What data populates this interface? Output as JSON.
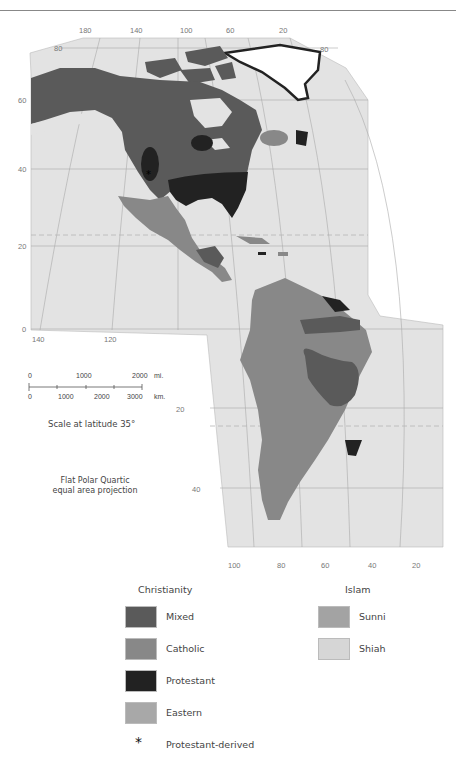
{
  "map": {
    "title": "Religions of the Americas",
    "projection": "Flat Polar Quartic equal area projection",
    "projection_line1": "Flat Polar Quartic",
    "projection_line2": "equal area projection",
    "colors": {
      "ocean": "#e3e3e3",
      "mixed": "#5a5a5a",
      "catholic": "#888888",
      "protestant": "#222222",
      "eastern": "#a8a8a8",
      "sunni": "#a3a3a3",
      "shiah": "#d6d6d6",
      "greenland_ice": "#ffffff",
      "grid": "#a9a9a9"
    },
    "top_longitude_ticks": [
      "180",
      "140",
      "100",
      "60",
      "20"
    ],
    "top_latitude_ticks": [
      "80",
      "80"
    ],
    "left_latitude_ticks": [
      "60",
      "40",
      "20",
      "0"
    ],
    "mid_longitude_ticks": [
      "140",
      "120"
    ],
    "south_latitude_ticks": [
      "20",
      "40"
    ],
    "bottom_longitude_ticks": [
      "100",
      "80",
      "60",
      "40",
      "20"
    ]
  },
  "scale": {
    "mi_labels": [
      "0",
      "1000",
      "2000"
    ],
    "mi_unit": "mi.",
    "km_labels": [
      "0",
      "1000",
      "2000",
      "3000"
    ],
    "km_unit": "km.",
    "caption": "Scale at latitude 35°"
  },
  "legend": {
    "christianity": {
      "heading": "Christianity",
      "items": [
        {
          "label": "Mixed",
          "color": "#5a5a5a"
        },
        {
          "label": "Catholic",
          "color": "#888888"
        },
        {
          "label": "Protestant",
          "color": "#222222"
        },
        {
          "label": "Eastern",
          "color": "#a8a8a8"
        }
      ],
      "marker": {
        "symbol": "*",
        "label": "Protestant-derived"
      }
    },
    "islam": {
      "heading": "Islam",
      "items": [
        {
          "label": "Sunni",
          "color": "#a3a3a3"
        },
        {
          "label": "Shiah",
          "color": "#d6d6d6"
        }
      ]
    }
  }
}
